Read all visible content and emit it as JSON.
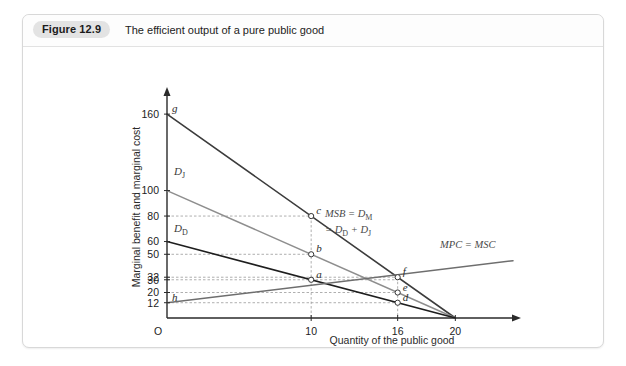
{
  "figure": {
    "badge": "Figure 12.9",
    "caption": "The efficient output of a pure public good"
  },
  "chart_data": {
    "type": "line",
    "title": "The efficient output of a pure public good",
    "xlabel": "Quantity of the public good",
    "ylabel": "Marginal benefit and marginal cost",
    "xlim": [
      0,
      24
    ],
    "ylim": [
      0,
      175
    ],
    "grid": "dashed-guide-lines",
    "origin_label": "O",
    "xticks": [
      {
        "value": 10,
        "label": "10"
      },
      {
        "value": 16,
        "label": "16"
      },
      {
        "value": 20,
        "label": "20"
      }
    ],
    "yticks": [
      {
        "value": 160,
        "label": "160"
      },
      {
        "value": 100,
        "label": "100"
      },
      {
        "value": 80,
        "label": "80"
      },
      {
        "value": 60,
        "label": "60"
      },
      {
        "value": 50,
        "label": "50"
      },
      {
        "value": 32,
        "label": "32"
      },
      {
        "value": 30,
        "label": "30"
      },
      {
        "value": 20,
        "label": "20"
      },
      {
        "value": 12,
        "label": "12"
      }
    ],
    "series": [
      {
        "name": "MSB = DM = DD + DJ",
        "label_main": "MSB = D",
        "label_main_sub": "M",
        "label_second": "= D",
        "label_second_sub1": "D",
        "label_second_mid": " + D",
        "label_second_sub2": "J",
        "color": "#3c3c3c",
        "width": 1.6,
        "points": [
          [
            0,
            160
          ],
          [
            20,
            0
          ]
        ]
      },
      {
        "name": "DJ",
        "label_main": "D",
        "label_main_sub": "J",
        "color": "#8e8e8e",
        "width": 1.5,
        "points": [
          [
            0,
            100
          ],
          [
            20,
            0
          ]
        ]
      },
      {
        "name": "DD",
        "label_main": "D",
        "label_main_sub": "D",
        "color": "#1e1e1e",
        "width": 1.6,
        "points": [
          [
            0,
            60
          ],
          [
            20,
            0
          ]
        ]
      },
      {
        "name": "MPC = MSC",
        "label_main": "MPC = MSC",
        "color": "#6e6e6e",
        "width": 1.5,
        "points": [
          [
            0,
            12
          ],
          [
            24,
            45
          ]
        ]
      }
    ],
    "points": [
      {
        "label": "g",
        "x": 0,
        "y": 160,
        "anchor": "right"
      },
      {
        "label": "h",
        "x": 0,
        "y": 12,
        "anchor": "right"
      },
      {
        "label": "c",
        "x": 10,
        "y": 80,
        "anchor": "right"
      },
      {
        "label": "b",
        "x": 10,
        "y": 50,
        "anchor": "right"
      },
      {
        "label": "a",
        "x": 10,
        "y": 30,
        "anchor": "right"
      },
      {
        "label": "f",
        "x": 16,
        "y": 32,
        "anchor": "right"
      },
      {
        "label": "e",
        "x": 16,
        "y": 20,
        "anchor": "right"
      },
      {
        "label": "d",
        "x": 16,
        "y": 12,
        "anchor": "right"
      }
    ],
    "guide_lines_horizontal": [
      80,
      50,
      32,
      30,
      20,
      12
    ],
    "guide_lines_vertical": [
      10,
      16
    ]
  }
}
